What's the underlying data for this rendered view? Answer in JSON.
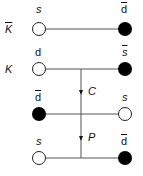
{
  "diagram": {
    "rows": [
      {
        "meson": "K",
        "meson_bar": true,
        "left_quark": "s",
        "left_bar": false,
        "left_italic": true,
        "left_fill": "open",
        "right_quark": "d",
        "right_bar": true,
        "right_italic": false,
        "right_fill": "filled"
      },
      {
        "meson": "K",
        "meson_bar": false,
        "left_quark": "d",
        "left_bar": false,
        "left_italic": false,
        "left_fill": "open",
        "right_quark": "s",
        "right_bar": true,
        "right_italic": true,
        "right_fill": "filled"
      },
      {
        "meson": "",
        "meson_bar": false,
        "left_quark": "d",
        "left_bar": true,
        "left_italic": false,
        "left_fill": "filled",
        "right_quark": "s",
        "right_bar": false,
        "right_italic": true,
        "right_fill": "open"
      },
      {
        "meson": "",
        "meson_bar": false,
        "left_quark": "s",
        "left_bar": false,
        "left_italic": true,
        "left_fill": "open",
        "right_quark": "d",
        "right_bar": true,
        "right_italic": false,
        "right_fill": "filled"
      }
    ],
    "operations": [
      {
        "label": "C"
      },
      {
        "label": "P"
      }
    ],
    "colors": {
      "line": "#555555",
      "filled": "#000000",
      "open": "#ffffff"
    }
  }
}
